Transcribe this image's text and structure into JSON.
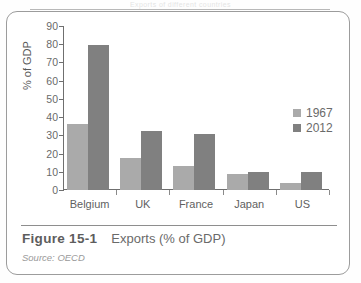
{
  "page": {
    "header_remnant": "Exports of different countries",
    "frame_color": "#9c9c9c"
  },
  "figure": {
    "number_label": "Figure 15-1",
    "title": "Exports (% of GDP)",
    "source": "Source: OECD"
  },
  "legend": {
    "position": "right",
    "entries": [
      {
        "label": "1967",
        "color": "#aaaaaa"
      },
      {
        "label": "2012",
        "color": "#808080"
      }
    ]
  },
  "axes": {
    "y_title": "% of GDP",
    "y_ticks": [
      "0",
      "10",
      "20",
      "30",
      "40",
      "50",
      "60",
      "70",
      "80",
      "90"
    ]
  },
  "chart_data": {
    "type": "bar",
    "title": "Exports (% of GDP)",
    "xlabel": "",
    "ylabel": "% of GDP",
    "ylim": [
      0,
      90
    ],
    "ytick_step": 10,
    "grid": false,
    "legend_position": "right",
    "categories": [
      "Belgium",
      "UK",
      "France",
      "Japan",
      "US"
    ],
    "series": [
      {
        "name": "1967",
        "color": "#aaaaaa",
        "values": [
          36,
          17.5,
          13,
          9,
          4
        ]
      },
      {
        "name": "2012",
        "color": "#808080",
        "values": [
          79.5,
          32.5,
          31,
          10,
          10
        ]
      }
    ],
    "source": "OECD"
  }
}
